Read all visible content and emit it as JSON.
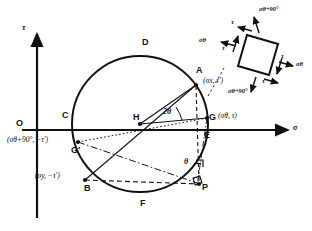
{
  "figure": {
    "type": "mohrs-circle-diagram",
    "axes": {
      "vertical_label": "τ",
      "horizontal_label": "σ",
      "origin_label": "O"
    },
    "points": [
      {
        "id": "D",
        "label": "D",
        "x": 145,
        "y": 44,
        "desc": "top of circle"
      },
      {
        "id": "A",
        "label": "A",
        "x": 201,
        "y": 74,
        "desc": "point A on circle"
      },
      {
        "id": "C",
        "label": "C",
        "x": 66,
        "y": 117,
        "desc": "left intersection with sigma axis"
      },
      {
        "id": "H",
        "label": "H",
        "x": 140,
        "y": 122,
        "desc": "center of circle"
      },
      {
        "id": "G",
        "label": "G",
        "x": 210,
        "y": 113,
        "desc": "point G on circle"
      },
      {
        "id": "E",
        "label": "E",
        "x": 205,
        "y": 134,
        "desc": "right intersection with sigma axis"
      },
      {
        "id": "Gp",
        "label": "G′",
        "x": 74,
        "y": 148,
        "desc": "point G prime on circle"
      },
      {
        "id": "B",
        "label": "B",
        "x": 92,
        "y": 190,
        "desc": "point B on circle"
      },
      {
        "id": "F",
        "label": "F",
        "x": 143,
        "y": 204,
        "desc": "bottom of circle"
      },
      {
        "id": "P",
        "label": "P",
        "x": 201,
        "y": 190,
        "desc": "pole point P"
      }
    ],
    "coordinate_labels": [
      {
        "for": "A",
        "text": "(σx, τ′)",
        "sym": "σ",
        "sub": "x",
        "tail": ", τ′)"
      },
      {
        "for": "G",
        "text": "(σθ, τ)",
        "sym": "σ",
        "sub": "θ",
        "tail": ", τ)"
      },
      {
        "for": "Gp",
        "text": "(σθ+90°, −τ′)",
        "sym": "σ",
        "sub": "θ+90°",
        "tail": ", −τ′)"
      },
      {
        "for": "B",
        "text": "(σy, −τ′)",
        "sym": "σ",
        "sub": "y",
        "tail": ", −τ′)"
      }
    ],
    "angles": [
      {
        "id": "two-theta",
        "label": "2θ",
        "desc": "angle at center H between HA and HG"
      },
      {
        "id": "theta",
        "label": "θ",
        "desc": "angle at P"
      }
    ],
    "stress_element": {
      "desc": "rotated square stress element",
      "labels": {
        "top_normal": "σθ+90°",
        "bottom_normal": "σθ+90°",
        "left_normal": "σθ",
        "right_normal": "σθ",
        "shear": "τ"
      },
      "shear_arrow_count": 4
    },
    "colors": {
      "stroke": "#111111",
      "background": "#ffffff"
    }
  }
}
